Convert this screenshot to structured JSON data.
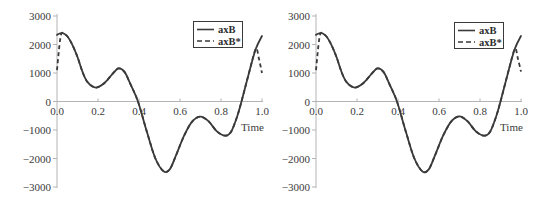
{
  "chart_data": [
    {
      "type": "line",
      "title": "",
      "xlabel": "Time",
      "ylabel": "",
      "xlim": [
        0,
        1
      ],
      "ylim": [
        -3000,
        3000
      ],
      "grid": false,
      "x_ticks": [
        "0.0",
        "0.2",
        "0.4",
        "0.6",
        "0.8",
        "1.0"
      ],
      "y_ticks": [
        "3000",
        "2000",
        "1000",
        "0",
        "−1000",
        "−2000",
        "−3000"
      ],
      "legend": {
        "position": "upper right",
        "entries": [
          "axB",
          "axB*"
        ]
      },
      "series": [
        {
          "name": "axB",
          "style": "solid",
          "color": "#3a3a3a",
          "x": [
            0.0,
            0.025,
            0.05,
            0.075,
            0.1,
            0.125,
            0.15,
            0.19,
            0.23,
            0.27,
            0.3,
            0.33,
            0.36,
            0.395,
            0.44,
            0.48,
            0.52,
            0.55,
            0.58,
            0.62,
            0.66,
            0.7,
            0.74,
            0.78,
            0.82,
            0.85,
            0.88,
            0.9,
            0.94,
            0.97,
            1.0
          ],
          "y": [
            2340,
            2410,
            2290,
            1990,
            1560,
            1030,
            670,
            490,
            640,
            960,
            1160,
            1030,
            580,
            0,
            -1100,
            -2000,
            -2450,
            -2380,
            -1900,
            -1200,
            -700,
            -530,
            -700,
            -1050,
            -1200,
            -1050,
            -500,
            0,
            1100,
            1850,
            2300
          ]
        },
        {
          "name": "axB*",
          "style": "dashed",
          "color": "#3a3a3a",
          "x": [
            0.0,
            0.008,
            0.016,
            0.025,
            0.05,
            0.075,
            0.1,
            0.125,
            0.15,
            0.19,
            0.23,
            0.27,
            0.3,
            0.33,
            0.36,
            0.395,
            0.44,
            0.48,
            0.52,
            0.55,
            0.58,
            0.62,
            0.66,
            0.7,
            0.74,
            0.78,
            0.82,
            0.85,
            0.88,
            0.9,
            0.94,
            0.97,
            0.985,
            1.0
          ],
          "y": [
            1100,
            1700,
            2200,
            2410,
            2290,
            1990,
            1560,
            1030,
            670,
            490,
            640,
            960,
            1160,
            1030,
            580,
            0,
            -1100,
            -2000,
            -2450,
            -2380,
            -1900,
            -1200,
            -700,
            -530,
            -700,
            -1050,
            -1200,
            -1050,
            -500,
            0,
            1100,
            1850,
            1500,
            1000
          ]
        }
      ]
    },
    {
      "type": "line",
      "title": "",
      "xlabel": "Time",
      "ylabel": "",
      "xlim": [
        0,
        1
      ],
      "ylim": [
        -3000,
        3000
      ],
      "grid": false,
      "x_ticks": [
        "0.0",
        "0.2",
        "0.4",
        "0.6",
        "0.8",
        "1.0"
      ],
      "y_ticks": [
        "3000",
        "2000",
        "1000",
        "0",
        "−1000",
        "−2000",
        "−3000"
      ],
      "legend": {
        "position": "upper right",
        "entries": [
          "axB",
          "axB*"
        ]
      },
      "series": [
        {
          "name": "axB",
          "style": "solid",
          "color": "#3a3a3a",
          "x": [
            0.0,
            0.025,
            0.05,
            0.075,
            0.1,
            0.125,
            0.15,
            0.19,
            0.23,
            0.27,
            0.3,
            0.33,
            0.36,
            0.395,
            0.44,
            0.48,
            0.52,
            0.55,
            0.58,
            0.62,
            0.66,
            0.7,
            0.74,
            0.78,
            0.82,
            0.85,
            0.88,
            0.9,
            0.94,
            0.97,
            1.0
          ],
          "y": [
            2340,
            2410,
            2290,
            1990,
            1560,
            1030,
            670,
            490,
            640,
            960,
            1160,
            1030,
            580,
            0,
            -1100,
            -2000,
            -2460,
            -2380,
            -1900,
            -1200,
            -700,
            -525,
            -700,
            -1050,
            -1200,
            -1050,
            -500,
            0,
            1100,
            1850,
            2300
          ]
        },
        {
          "name": "axB*",
          "style": "dashed",
          "color": "#3a3a3a",
          "x": [
            0.0,
            0.008,
            0.016,
            0.025,
            0.05,
            0.075,
            0.1,
            0.125,
            0.15,
            0.19,
            0.23,
            0.27,
            0.3,
            0.33,
            0.36,
            0.395,
            0.44,
            0.48,
            0.52,
            0.55,
            0.58,
            0.62,
            0.66,
            0.7,
            0.74,
            0.78,
            0.82,
            0.85,
            0.88,
            0.9,
            0.94,
            0.97,
            0.985,
            1.0
          ],
          "y": [
            1100,
            1700,
            2200,
            2410,
            2290,
            1990,
            1560,
            1030,
            670,
            490,
            640,
            960,
            1160,
            1030,
            580,
            0,
            -1100,
            -2000,
            -2460,
            -2380,
            -1900,
            -1200,
            -700,
            -525,
            -700,
            -1050,
            -1200,
            -1050,
            -500,
            0,
            1100,
            1850,
            1500,
            1050
          ]
        }
      ]
    }
  ]
}
